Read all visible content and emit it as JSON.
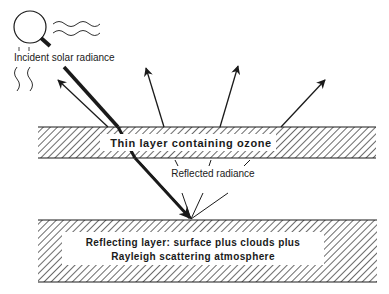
{
  "diagram": {
    "labels": {
      "incident": "Incident solar radiance",
      "ozone_layer": "Thin layer containing ozone",
      "reflected": "Reflected radiance",
      "reflecting_line1": "Reflecting layer:  surface plus clouds plus",
      "reflecting_line2": "Rayleigh scattering atmosphere"
    },
    "icons": {
      "sun": "sun-icon"
    },
    "colors": {
      "ink": "#1a1a1a",
      "background": "#ffffff"
    }
  }
}
